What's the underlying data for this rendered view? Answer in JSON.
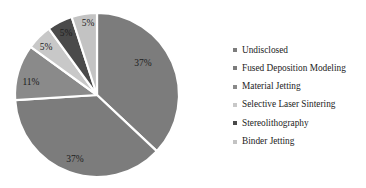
{
  "chart_data": {
    "type": "pie",
    "title": "",
    "categories": [
      "Undisclosed",
      "Fused Deposition Modeling",
      "Material Jetting",
      "Selective Laser Sintering",
      "Stereolithography",
      "Binder Jetting"
    ],
    "values": [
      37,
      37,
      11,
      5,
      5,
      5
    ],
    "data_labels": [
      "37%",
      "37%",
      "11%",
      "5%",
      "5%",
      "5%"
    ],
    "colors": [
      "#7c7c7c",
      "#7c7c7c",
      "#8a8a8a",
      "#c8c8c8",
      "#4a4a4a",
      "#c3c3c3"
    ],
    "legend_position": "right",
    "start_angle_deg": 0,
    "direction": "clockwise",
    "grid": false,
    "xlabel": "",
    "ylabel": "",
    "slices": [
      {
        "label": "Undisclosed",
        "value": 37,
        "data_label": "37%",
        "color": "#7c7c7c",
        "label_x": 143,
        "label_y": 64
      },
      {
        "label": "Fused Deposition Modeling",
        "value": 37,
        "data_label": "37%",
        "color": "#7c7c7c",
        "label_x": 75,
        "label_y": 160
      },
      {
        "label": "Material Jetting",
        "value": 11,
        "data_label": "11%",
        "color": "#8a8a8a",
        "label_x": 31,
        "label_y": 83
      },
      {
        "label": "Selective Laser Sintering",
        "value": 5,
        "data_label": "5%",
        "color": "#c8c8c8",
        "label_x": 46,
        "label_y": 48
      },
      {
        "label": "Stereolithography",
        "value": 5,
        "data_label": "5%",
        "color": "#4a4a4a",
        "label_x": 66,
        "label_y": 34
      },
      {
        "label": "Binder Jetting",
        "value": 5,
        "data_label": "5%",
        "color": "#c3c3c3",
        "label_x": 88,
        "label_y": 24
      }
    ]
  },
  "legend": {
    "items": [
      {
        "label": "Undisclosed",
        "color": "#7c7c7c"
      },
      {
        "label": "Fused Deposition Modeling",
        "color": "#7c7c7c"
      },
      {
        "label": "Material Jetting",
        "color": "#8a8a8a"
      },
      {
        "label": "Selective Laser Sintering",
        "color": "#c8c8c8"
      },
      {
        "label": "Stereolithography",
        "color": "#4a4a4a"
      },
      {
        "label": "Binder Jetting",
        "color": "#c3c3c3"
      }
    ]
  }
}
